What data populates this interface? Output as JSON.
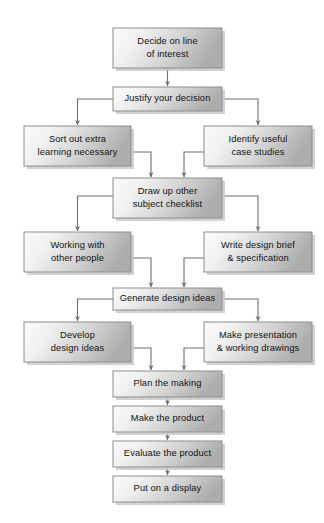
{
  "diagram": {
    "background_color": "#ffffff",
    "box_fill_light": "#f7f7f7",
    "box_fill_dark": "#b5b5b5",
    "box_border_color": "#8d8d8d",
    "connector_color": "#6f6f6f",
    "text_color": "#111111"
  },
  "nodes": [
    {
      "id": "decide-on-line-of-interest",
      "lines": [
        "Decide on line",
        "of interest"
      ],
      "x": 113,
      "y": 28,
      "w": 109,
      "h": 40
    },
    {
      "id": "justify-your-decision",
      "lines": [
        "Justify your decision"
      ],
      "x": 113,
      "y": 87,
      "w": 109,
      "h": 24
    },
    {
      "id": "sort-out-extra-learning-necessary",
      "lines": [
        "Sort out extra",
        "learning necessary"
      ],
      "x": 24,
      "y": 126,
      "w": 107,
      "h": 40
    },
    {
      "id": "identify-useful-case-studies",
      "lines": [
        "Identify useful",
        "case studies"
      ],
      "x": 204,
      "y": 126,
      "w": 108,
      "h": 40
    },
    {
      "id": "draw-up-other-subject-checklist",
      "lines": [
        "Draw up other",
        "subject checklist"
      ],
      "x": 113,
      "y": 178,
      "w": 109,
      "h": 40
    },
    {
      "id": "working-with-other-people",
      "lines": [
        "Working with",
        "other people"
      ],
      "x": 24,
      "y": 232,
      "w": 107,
      "h": 40
    },
    {
      "id": "write-design-brief-and-specification",
      "lines": [
        "Write design brief",
        "& specification"
      ],
      "x": 204,
      "y": 232,
      "w": 108,
      "h": 40
    },
    {
      "id": "generate-design-ideas",
      "lines": [
        "Generate design ideas"
      ],
      "x": 113,
      "y": 288,
      "w": 109,
      "h": 22
    },
    {
      "id": "develop-design-ideas",
      "lines": [
        "Develop",
        "design ideas"
      ],
      "x": 24,
      "y": 322,
      "w": 107,
      "h": 40
    },
    {
      "id": "make-presentation-and-working-drawings",
      "lines": [
        "Make presentation",
        "& working drawings"
      ],
      "x": 204,
      "y": 322,
      "w": 108,
      "h": 40
    },
    {
      "id": "plan-the-making",
      "lines": [
        "Plan the making"
      ],
      "x": 113,
      "y": 371,
      "w": 109,
      "h": 26
    },
    {
      "id": "make-the-product",
      "lines": [
        "Make the product"
      ],
      "x": 113,
      "y": 406,
      "w": 109,
      "h": 26
    },
    {
      "id": "evaluate-the-product",
      "lines": [
        "Evaluate the product"
      ],
      "x": 113,
      "y": 441,
      "w": 109,
      "h": 26
    },
    {
      "id": "put-on-a-display",
      "lines": [
        "Put on a display"
      ],
      "x": 113,
      "y": 476,
      "w": 109,
      "h": 26
    }
  ],
  "chart_data": {
    "type": "diagram",
    "diagram_type": "flowchart",
    "steps": [
      "Decide on line of interest",
      "Justify your decision",
      "Sort out extra learning necessary",
      "Identify useful case studies",
      "Draw up other subject checklist",
      "Working with other people",
      "Write design brief & specification",
      "Generate design ideas",
      "Develop design ideas",
      "Make presentation & working drawings",
      "Plan the making",
      "Make the product",
      "Evaluate the product",
      "Put on a display"
    ],
    "edges": [
      {
        "from": "Decide on line of interest",
        "to": "Justify your decision"
      },
      {
        "from": "Justify your decision",
        "to": "Sort out extra learning necessary"
      },
      {
        "from": "Justify your decision",
        "to": "Identify useful case studies"
      },
      {
        "from": "Sort out extra learning necessary",
        "to": "Draw up other subject checklist"
      },
      {
        "from": "Identify useful case studies",
        "to": "Draw up other subject checklist"
      },
      {
        "from": "Draw up other subject checklist",
        "to": "Working with other people"
      },
      {
        "from": "Draw up other subject checklist",
        "to": "Write design brief & specification"
      },
      {
        "from": "Working with other people",
        "to": "Generate design ideas"
      },
      {
        "from": "Write design brief & specification",
        "to": "Generate design ideas"
      },
      {
        "from": "Generate design ideas",
        "to": "Develop design ideas"
      },
      {
        "from": "Generate design ideas",
        "to": "Make presentation & working drawings"
      },
      {
        "from": "Develop design ideas",
        "to": "Plan the making"
      },
      {
        "from": "Make presentation & working drawings",
        "to": "Plan the making"
      },
      {
        "from": "Plan the making",
        "to": "Make the product"
      },
      {
        "from": "Make the product",
        "to": "Evaluate the product"
      },
      {
        "from": "Evaluate the product",
        "to": "Put on a display"
      }
    ]
  }
}
